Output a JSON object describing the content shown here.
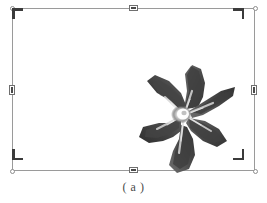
{
  "figure": {
    "caption": "( a )",
    "subject_description": "five-petaled periwinkle flower, grayscale"
  },
  "canvas": {
    "background_color": "#ffffff",
    "page_background_color": "#fdfdfc",
    "border_color": "#9a9a9a"
  },
  "selection": {
    "frame_label": "selection-frame",
    "handles": [
      {
        "name": "handle-top-center",
        "position": "top-center",
        "shape": "rectangle"
      },
      {
        "name": "handle-bottom-center",
        "position": "bottom-center",
        "shape": "rectangle"
      },
      {
        "name": "handle-middle-left",
        "position": "middle-left",
        "shape": "rectangle"
      },
      {
        "name": "handle-middle-right",
        "position": "middle-right",
        "shape": "rectangle"
      }
    ],
    "corner_marks": [
      {
        "name": "crop-mark-top-left",
        "position": "top-left"
      },
      {
        "name": "crop-mark-top-right",
        "position": "top-right"
      },
      {
        "name": "crop-mark-bottom-left",
        "position": "bottom-left"
      },
      {
        "name": "crop-mark-bottom-right",
        "position": "bottom-right"
      }
    ],
    "corner_dots": [
      {
        "name": "corner-dot-top-left",
        "position": "top-left"
      },
      {
        "name": "corner-dot-top-right",
        "position": "top-right"
      },
      {
        "name": "corner-dot-bottom-left",
        "position": "bottom-left"
      },
      {
        "name": "corner-dot-bottom-right",
        "position": "bottom-right"
      }
    ],
    "handle_fill_color": "#4a4a4a",
    "mark_color": "#3b3b3b"
  },
  "flower": {
    "petal_dark": "#3a3a3a",
    "petal_mid": "#555555",
    "petal_light": "#7d7d7d",
    "center_highlight": "#ffffff",
    "petal_count": 5
  }
}
